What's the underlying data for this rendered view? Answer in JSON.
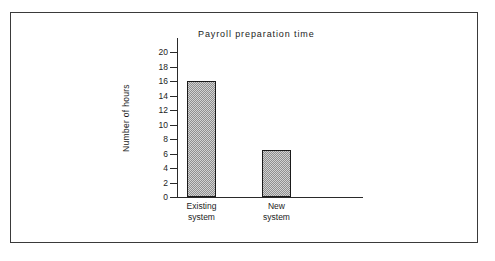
{
  "chart_data": {
    "type": "bar",
    "title": "Payroll preparation time",
    "xlabel": "",
    "ylabel": "Number of hours",
    "categories": [
      "Existing system",
      "New system"
    ],
    "category_lines": [
      [
        "Existing",
        "system"
      ],
      [
        "New",
        "system"
      ]
    ],
    "values": [
      16,
      6.5
    ],
    "ylim": [
      0,
      20
    ],
    "yticks": [
      0,
      2,
      4,
      6,
      8,
      10,
      12,
      14,
      16,
      18,
      20
    ],
    "ytick_labels": [
      "0",
      "2",
      "4",
      "6",
      "8",
      "10",
      "12",
      "14",
      "16",
      "18",
      "20"
    ],
    "grid": false,
    "legend": false,
    "bar_fill": "#d2d2d2",
    "bar_pattern": "checkered-stipple",
    "bar_border_color": "#1a1a1a",
    "axis_color": "#2a2a2a",
    "text_color": "#1c1c1c",
    "background": "#ffffff",
    "frame_color": "#3a3a3a"
  }
}
